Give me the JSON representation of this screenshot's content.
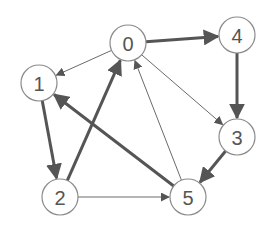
{
  "diagram": {
    "type": "directed-graph",
    "node_radius": 18,
    "colors": {
      "node_stroke": "#8a8a8a",
      "edge": "#555555",
      "label": "#555555",
      "background": "#ffffff"
    },
    "nodes": [
      {
        "id": "0",
        "label": "0",
        "x": 128,
        "y": 43
      },
      {
        "id": "1",
        "label": "1",
        "x": 39,
        "y": 83
      },
      {
        "id": "2",
        "label": "2",
        "x": 60,
        "y": 197
      },
      {
        "id": "3",
        "label": "3",
        "x": 237,
        "y": 137
      },
      {
        "id": "4",
        "label": "4",
        "x": 237,
        "y": 35
      },
      {
        "id": "5",
        "label": "5",
        "x": 188,
        "y": 197
      }
    ],
    "edges": [
      {
        "from": "0",
        "to": "1",
        "weight": "thin"
      },
      {
        "from": "0",
        "to": "4",
        "weight": "thick"
      },
      {
        "from": "0",
        "to": "3",
        "weight": "thin"
      },
      {
        "from": "1",
        "to": "2",
        "weight": "thick"
      },
      {
        "from": "2",
        "to": "0",
        "weight": "thick"
      },
      {
        "from": "2",
        "to": "5",
        "weight": "thin"
      },
      {
        "from": "5",
        "to": "0",
        "weight": "thin"
      },
      {
        "from": "5",
        "to": "1",
        "weight": "thick"
      },
      {
        "from": "4",
        "to": "3",
        "weight": "thick"
      },
      {
        "from": "3",
        "to": "5",
        "weight": "thick"
      }
    ]
  }
}
